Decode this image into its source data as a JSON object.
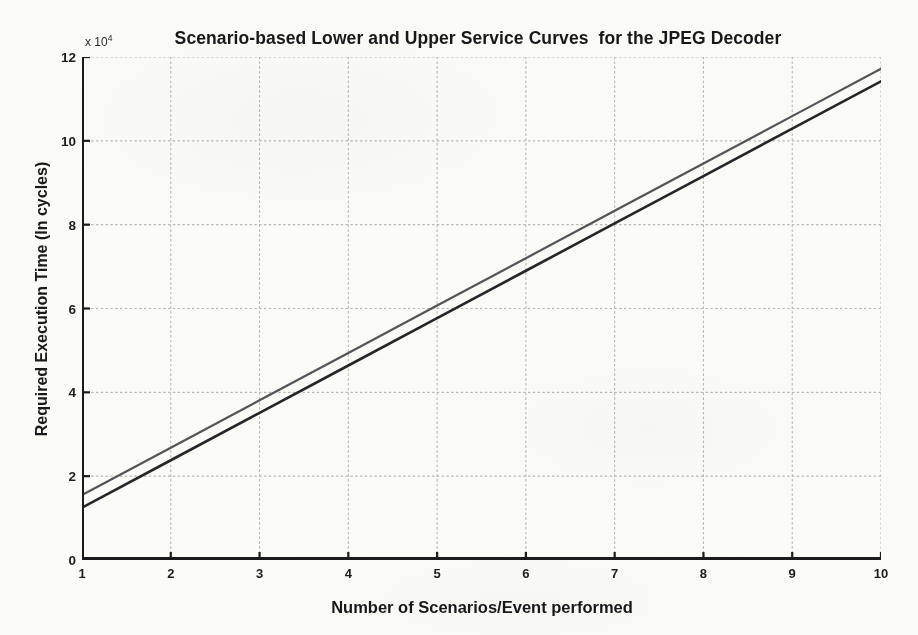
{
  "chart_data": {
    "type": "line",
    "title": "Scenario-based Lower and Upper Service Curves  for the JPEG Decoder",
    "xlabel": "Number of Scenarios/Event performed",
    "ylabel": "Required Execution Time (In cycles)",
    "y_multiplier_label": "x 10",
    "y_multiplier_exponent": "4",
    "y_multiplier_value": 10000,
    "xlim": [
      1,
      10
    ],
    "ylim": [
      0,
      12
    ],
    "xticks": [
      1,
      2,
      3,
      4,
      5,
      6,
      7,
      8,
      9,
      10
    ],
    "yticks": [
      0,
      2,
      4,
      6,
      8,
      10,
      12
    ],
    "grid": true,
    "grid_style": "dotted",
    "grid_color": "#b9b9b9",
    "legend": "none",
    "axis_color": "#1b1b1d",
    "x": [
      1,
      2,
      3,
      4,
      5,
      6,
      7,
      8,
      9,
      10
    ],
    "series": [
      {
        "name": "Upper Service Curve",
        "color": "#55555a",
        "width": 2.2,
        "values": [
          1.55,
          2.68,
          3.81,
          4.94,
          6.07,
          7.2,
          8.33,
          9.46,
          10.59,
          11.72
        ]
      },
      {
        "name": "Lower Service Curve",
        "color": "#26262a",
        "width": 2.6,
        "values": [
          1.25,
          2.38,
          3.51,
          4.64,
          5.77,
          6.9,
          8.03,
          9.16,
          10.29,
          11.42
        ]
      }
    ],
    "annotations": []
  }
}
